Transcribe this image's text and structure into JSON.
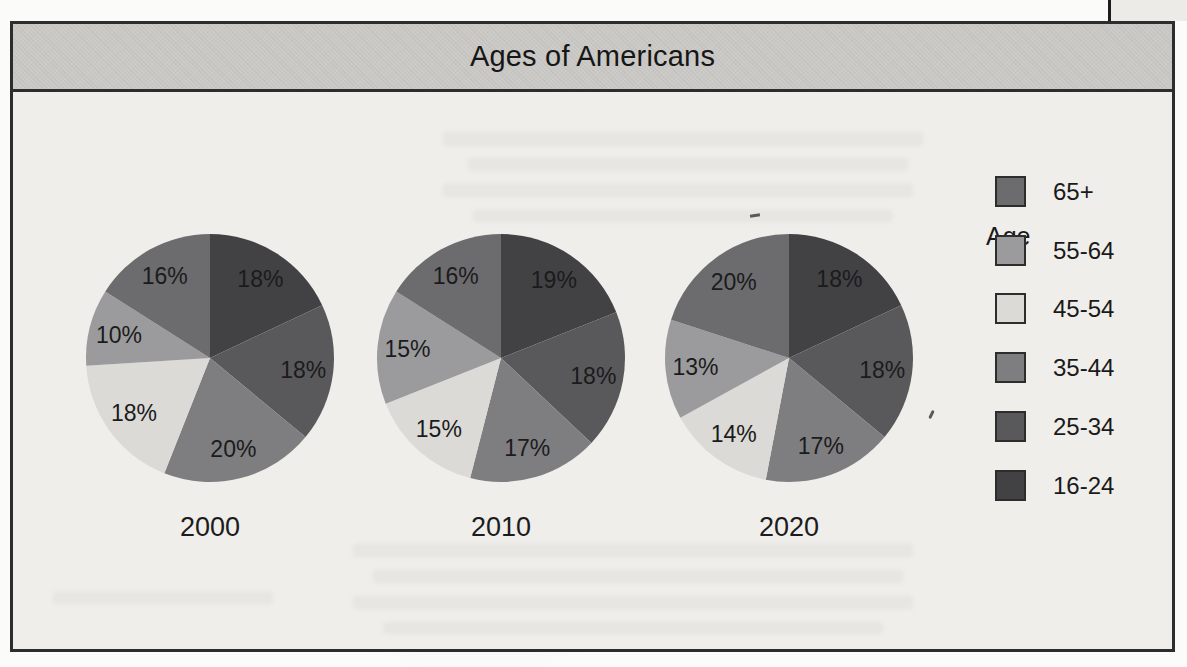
{
  "chart_data": {
    "type": "pie",
    "title": "Ages of Americans",
    "unit": "%",
    "legend": {
      "title": "Age",
      "entries": [
        "65+",
        "55-64",
        "45-54",
        "35-44",
        "25-34",
        "16-24"
      ]
    },
    "colors": {
      "65+": "#6c6c6f",
      "55-64": "#9b9b9e",
      "45-54": "#dbdad7",
      "35-44": "#7e7e81",
      "25-34": "#59595c",
      "16-24": "#424245"
    },
    "slice_order_clockwise_from_top": [
      "16-24",
      "25-34",
      "35-44",
      "45-54",
      "55-64",
      "65+"
    ],
    "series": [
      {
        "name": "2000",
        "values": {
          "16-24": 18,
          "25-34": 18,
          "35-44": 20,
          "45-54": 18,
          "55-64": 10,
          "65+": 16
        }
      },
      {
        "name": "2010",
        "values": {
          "16-24": 19,
          "25-34": 18,
          "35-44": 17,
          "45-54": 15,
          "55-64": 15,
          "65+": 16
        }
      },
      {
        "name": "2020",
        "values": {
          "16-24": 18,
          "25-34": 18,
          "35-44": 17,
          "45-54": 14,
          "55-64": 13,
          "65+": 20
        }
      }
    ],
    "label_format": "{value}%"
  }
}
